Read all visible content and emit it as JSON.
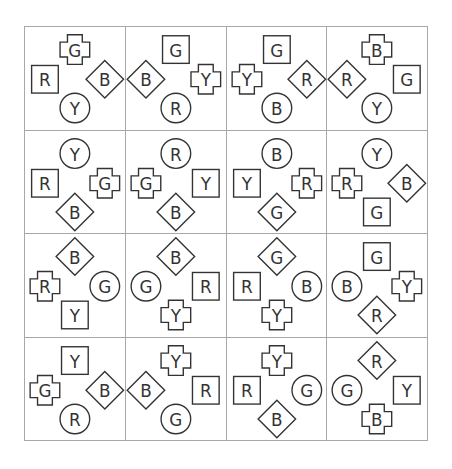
{
  "puzzle": {
    "rows": 4,
    "cols": 4,
    "slots": [
      "top",
      "left",
      "right",
      "bottom"
    ],
    "colors": {
      "grid_line": "#a8a8a8",
      "shape_stroke": "#333333"
    },
    "cells": [
      [
        {
          "top": {
            "shape": "cross",
            "letter": "G"
          },
          "left": {
            "shape": "square",
            "letter": "R"
          },
          "right": {
            "shape": "diamond",
            "letter": "B"
          },
          "bottom": {
            "shape": "circle",
            "letter": "Y"
          }
        },
        {
          "top": {
            "shape": "square",
            "letter": "G"
          },
          "left": {
            "shape": "diamond",
            "letter": "B"
          },
          "right": {
            "shape": "cross",
            "letter": "Y"
          },
          "bottom": {
            "shape": "circle",
            "letter": "R"
          }
        },
        {
          "top": {
            "shape": "square",
            "letter": "G"
          },
          "left": {
            "shape": "cross",
            "letter": "Y"
          },
          "right": {
            "shape": "diamond",
            "letter": "R"
          },
          "bottom": {
            "shape": "circle",
            "letter": "B"
          }
        },
        {
          "top": {
            "shape": "cross",
            "letter": "B"
          },
          "left": {
            "shape": "diamond",
            "letter": "R"
          },
          "right": {
            "shape": "square",
            "letter": "G"
          },
          "bottom": {
            "shape": "circle",
            "letter": "Y"
          }
        }
      ],
      [
        {
          "top": {
            "shape": "circle",
            "letter": "Y"
          },
          "left": {
            "shape": "square",
            "letter": "R"
          },
          "right": {
            "shape": "cross",
            "letter": "G"
          },
          "bottom": {
            "shape": "diamond",
            "letter": "B"
          }
        },
        {
          "top": {
            "shape": "circle",
            "letter": "R"
          },
          "left": {
            "shape": "cross",
            "letter": "G"
          },
          "right": {
            "shape": "square",
            "letter": "Y"
          },
          "bottom": {
            "shape": "diamond",
            "letter": "B"
          }
        },
        {
          "top": {
            "shape": "circle",
            "letter": "B"
          },
          "left": {
            "shape": "square",
            "letter": "Y"
          },
          "right": {
            "shape": "cross",
            "letter": "R"
          },
          "bottom": {
            "shape": "diamond",
            "letter": "G"
          }
        },
        {
          "top": {
            "shape": "circle",
            "letter": "Y"
          },
          "left": {
            "shape": "cross",
            "letter": "R"
          },
          "right": {
            "shape": "diamond",
            "letter": "B"
          },
          "bottom": {
            "shape": "square",
            "letter": "G"
          }
        }
      ],
      [
        {
          "top": {
            "shape": "diamond",
            "letter": "B"
          },
          "left": {
            "shape": "cross",
            "letter": "R"
          },
          "right": {
            "shape": "circle",
            "letter": "G"
          },
          "bottom": {
            "shape": "square",
            "letter": "Y"
          }
        },
        {
          "top": {
            "shape": "diamond",
            "letter": "B"
          },
          "left": {
            "shape": "circle",
            "letter": "G"
          },
          "right": {
            "shape": "square",
            "letter": "R"
          },
          "bottom": {
            "shape": "cross",
            "letter": "Y"
          }
        },
        {
          "top": {
            "shape": "diamond",
            "letter": "G"
          },
          "left": {
            "shape": "square",
            "letter": "R"
          },
          "right": {
            "shape": "circle",
            "letter": "B"
          },
          "bottom": {
            "shape": "cross",
            "letter": "Y"
          }
        },
        {
          "top": {
            "shape": "square",
            "letter": "G"
          },
          "left": {
            "shape": "circle",
            "letter": "B"
          },
          "right": {
            "shape": "cross",
            "letter": "Y"
          },
          "bottom": {
            "shape": "diamond",
            "letter": "R"
          }
        }
      ],
      [
        {
          "top": {
            "shape": "square",
            "letter": "Y"
          },
          "left": {
            "shape": "cross",
            "letter": "G"
          },
          "right": {
            "shape": "diamond",
            "letter": "B"
          },
          "bottom": {
            "shape": "circle",
            "letter": "R"
          }
        },
        {
          "top": {
            "shape": "cross",
            "letter": "Y"
          },
          "left": {
            "shape": "diamond",
            "letter": "B"
          },
          "right": {
            "shape": "square",
            "letter": "R"
          },
          "bottom": {
            "shape": "circle",
            "letter": "G"
          }
        },
        {
          "top": {
            "shape": "cross",
            "letter": "Y"
          },
          "left": {
            "shape": "square",
            "letter": "R"
          },
          "right": {
            "shape": "circle",
            "letter": "G"
          },
          "bottom": {
            "shape": "diamond",
            "letter": "B"
          }
        },
        {
          "top": {
            "shape": "diamond",
            "letter": "R"
          },
          "left": {
            "shape": "circle",
            "letter": "G"
          },
          "right": {
            "shape": "square",
            "letter": "Y"
          },
          "bottom": {
            "shape": "cross",
            "letter": "B"
          }
        }
      ]
    ]
  }
}
